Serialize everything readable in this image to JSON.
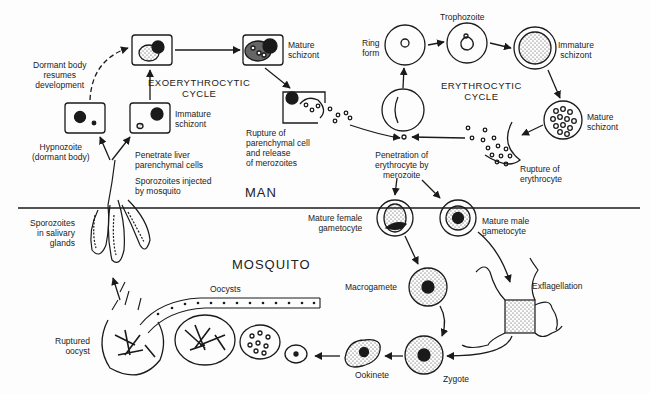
{
  "diagram": {
    "type": "life-cycle",
    "regions": {
      "man": "MAN",
      "mosquito": "MOSQUITO"
    },
    "cycles": {
      "exoerythrocytic": "EXOERYTHROCYTIC\nCYCLE",
      "erythrocytic": "ERYTHROCYTIC\nCYCLE"
    },
    "labels": {
      "dormant_resumes": "Dormant body\nresumes\ndevelopment",
      "hypnozoite": "Hypnozoite\n(dormant body)",
      "immature_schizont_liver": "Immature\nschizont",
      "mature_schizont_liver": "Mature\nschizont",
      "rupture_parenchymal": "Rupture of\nparenchymal cell\nand release\nof merozoites",
      "penetrate_liver": "Penetrate liver\nparenchymal cells",
      "sporozoites_injected": "Sporozoites injected\nby mosquito",
      "ring_form": "Ring\nform",
      "trophozoite": "Trophozoite",
      "immature_schizont_rbc": "Immature\nschizont",
      "mature_schizont_rbc": "Mature\nschizont",
      "rupture_erythrocyte": "Rupture of\nerythrocyte",
      "penetration_erythrocyte": "Penetration of\nerythrocyte by\nmerozoite",
      "mature_female_gametocyte": "Mature female\ngametocyte",
      "mature_male_gametocyte": "Mature male\ngametocyte",
      "sporozoites_salivary": "Sporozoites\nin salivary\nglands",
      "macrogamete": "Macrogamete",
      "exflagellation": "Exflagellation",
      "oocysts": "Oocysts",
      "ruptured_oocyst": "Ruptured\noocyst",
      "ookinete": "Ookinete",
      "zygote": "Zygote"
    },
    "colors": {
      "ink": "#1a1a1a",
      "background": "#fdfdfd"
    }
  }
}
